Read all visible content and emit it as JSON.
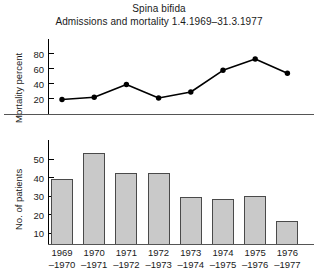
{
  "chart_data": [
    {
      "type": "line",
      "title": "Spina bifida",
      "subtitle": "Admissions and mortality 1.4.1969–31.3.1977",
      "ylabel": "Mortality percent",
      "xlabel": "",
      "categories": [
        "1969–1970",
        "1970–1971",
        "1971–1972",
        "1972–1973",
        "1973–1974",
        "1974–1975",
        "1975–1976",
        "1976–1977"
      ],
      "values": [
        18,
        21,
        38,
        20,
        28,
        57,
        72,
        53
      ],
      "yticks": [
        20,
        40,
        60,
        80
      ],
      "ytick_labels": [
        "20",
        "40",
        "60",
        "80"
      ],
      "ylim": [
        0,
        90
      ],
      "grid": false,
      "legend": "none",
      "marker": "filled-circle",
      "line_color": "#000000"
    },
    {
      "type": "bar",
      "title": "",
      "ylabel": "No. of patients",
      "xlabel": "",
      "categories": [
        "1969–1970",
        "1970–1971",
        "1971–1972",
        "1972–1973",
        "1973–1974",
        "1974–1975",
        "1975–1976",
        "1976–1977"
      ],
      "values": [
        39,
        53,
        42,
        42,
        29,
        28,
        30,
        16
      ],
      "yticks": [
        10,
        20,
        30,
        40,
        50
      ],
      "ytick_labels": [
        "10",
        "20",
        "30",
        "40",
        "50"
      ],
      "ylim": [
        0,
        57
      ],
      "grid": false,
      "legend": "none",
      "bar_fill": "#c9c9c9",
      "bar_stroke": "#4a4a4a"
    }
  ],
  "figure": {
    "title_main": "Spina bifida",
    "title_sub": "Admissions and mortality 1.4.1969–31.3.1977",
    "line_axis_label": "Mortality percent",
    "bar_axis_label": "No. of patients",
    "line_yticks": [
      "80",
      "60",
      "40",
      "20"
    ],
    "bar_yticks": [
      "50",
      "40",
      "30",
      "20",
      "10"
    ],
    "xlabels": [
      {
        "top": "1969",
        "bottom": "–1970"
      },
      {
        "top": "1970",
        "bottom": "–1971"
      },
      {
        "top": "1971",
        "bottom": "–1972"
      },
      {
        "top": "1972",
        "bottom": "–1973"
      },
      {
        "top": "1973",
        "bottom": "–1974"
      },
      {
        "top": "1974",
        "bottom": "–1975"
      },
      {
        "top": "1975",
        "bottom": "–1976"
      },
      {
        "top": "1976",
        "bottom": "–1977"
      }
    ]
  }
}
